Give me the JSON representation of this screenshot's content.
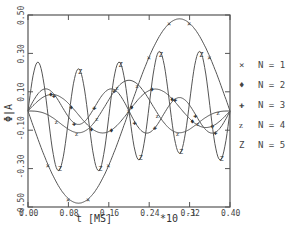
{
  "chart_data": {
    "type": "line",
    "title": "",
    "xlabel": "t [MS]",
    "x_multiplier": "*10^-1",
    "ylabel": "Φ|A",
    "xlim": [
      0.0,
      0.4
    ],
    "ylim": [
      -0.5,
      0.5
    ],
    "grid": false,
    "legend_position": "right",
    "x_ticks": [
      "0.00",
      "0.08",
      "0.16",
      "0.24",
      "0.32",
      "0.40"
    ],
    "y_ticks": [
      "0.50",
      "0.30",
      "0.10",
      "-0.10",
      "-0.30",
      "-0.50"
    ],
    "series": [
      {
        "name": "N = 1",
        "marker": "×",
        "terms": [
          {
            "amp": -0.48,
            "k": 2
          }
        ]
      },
      {
        "name": "N = 2",
        "marker": "♦",
        "terms": [
          {
            "amp": 0.1,
            "k": 4
          },
          {
            "amp": -0.02,
            "k": 2
          }
        ]
      },
      {
        "name": "N = 3",
        "marker": "✚",
        "terms": [
          {
            "amp": 0.1,
            "k": 6
          },
          {
            "amp": 0.03,
            "k": 2
          }
        ]
      },
      {
        "name": "N = 4",
        "marker": "ᴢ",
        "terms": [
          {
            "amp": -0.1,
            "k": 3
          },
          {
            "amp": 0.06,
            "k": 5
          }
        ]
      },
      {
        "name": "N = 5",
        "marker": "Z",
        "terms": [
          {
            "amp": 0.27,
            "k": 10
          },
          {
            "amp": -0.05,
            "k": 2
          }
        ]
      }
    ]
  },
  "axis": {
    "xlabel": "t [MS]",
    "multiplier": "*10",
    "multiplier_exp": "-1",
    "ylabel": "Φ|A"
  },
  "legend": [
    {
      "marker": "×",
      "label": "N = 1"
    },
    {
      "marker": "♦",
      "label": "N = 2"
    },
    {
      "marker": "✚",
      "label": "N = 3"
    },
    {
      "marker": "ᴢ",
      "label": "N = 4"
    },
    {
      "marker": "Z",
      "label": "N = 5"
    }
  ]
}
